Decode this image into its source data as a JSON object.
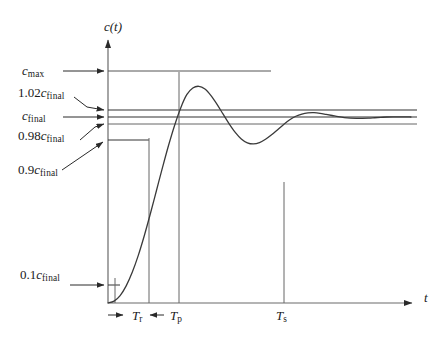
{
  "figure": {
    "title_axis_y": "c(t)",
    "title_axis_x": "t",
    "colors": {
      "curve": "#3a3a3a",
      "axis": "#555555",
      "guide": "#444444",
      "text": "#1a1a1a",
      "background": "#ffffff"
    }
  },
  "labels": {
    "c_max": {
      "coef": "",
      "base": "c",
      "sub": "max"
    },
    "c_102": {
      "coef": "1.02",
      "base": "c",
      "sub": "final"
    },
    "c_final": {
      "coef": "",
      "base": "c",
      "sub": "final"
    },
    "c_098": {
      "coef": "0.98",
      "base": "c",
      "sub": "final"
    },
    "c_09": {
      "coef": "0.9",
      "base": "c",
      "sub": "final"
    },
    "c_01": {
      "coef": "0.1",
      "base": "c",
      "sub": "final"
    },
    "t_r": {
      "base": "T",
      "sub": "r"
    },
    "t_p": {
      "base": "T",
      "sub": "p"
    },
    "t_s": {
      "base": "T",
      "sub": "s"
    }
  },
  "chart_data": {
    "type": "line",
    "title": "",
    "xlabel": "t",
    "ylabel": "c(t)",
    "grid": false,
    "legend": false,
    "levels": [
      {
        "name": "c_max",
        "label": "c max",
        "value": 1.165,
        "line_to_x": 0.53
      },
      {
        "name": "1.02c_final",
        "label": "1.02 c final",
        "value": 1.02,
        "line_to_x": 1.0
      },
      {
        "name": "c_final",
        "label": "c final",
        "value": 1.0,
        "line_to_x": 1.0
      },
      {
        "name": "0.98c_final",
        "label": "0.98 c final",
        "value": 0.98,
        "line_to_x": 1.0
      },
      {
        "name": "0.9c_final",
        "label": "0.9 c final",
        "value": 0.9,
        "line_to_x": 0.135
      },
      {
        "name": "0.1c_final",
        "label": "0.1 c final",
        "value": 0.1,
        "line_to_x": 0.05
      }
    ],
    "time_markers": [
      {
        "name": "T_r",
        "label": "T r",
        "x": 0.135,
        "meaning": "rise time"
      },
      {
        "name": "T_p",
        "label": "T p",
        "x": 0.3,
        "meaning": "peak time"
      },
      {
        "name": "T_s",
        "label": "T s",
        "x": 0.755,
        "meaning": "settling time"
      }
    ],
    "x": [
      0.0,
      0.02,
      0.04,
      0.06,
      0.08,
      0.1,
      0.12,
      0.14,
      0.16,
      0.18,
      0.2,
      0.22,
      0.24,
      0.26,
      0.28,
      0.3,
      0.32,
      0.34,
      0.36,
      0.38,
      0.4,
      0.42,
      0.44,
      0.46,
      0.48,
      0.5,
      0.52,
      0.54,
      0.56,
      0.58,
      0.6,
      0.62,
      0.64,
      0.66,
      0.68,
      0.7,
      0.72,
      0.74,
      0.76,
      0.78,
      0.8,
      0.82,
      0.84,
      0.86,
      0.88,
      0.9,
      0.92,
      0.94,
      0.96,
      0.98,
      1.0
    ],
    "y": [
      0.0,
      0.01,
      0.04,
      0.092,
      0.165,
      0.256,
      0.363,
      0.481,
      0.605,
      0.729,
      0.848,
      0.956,
      1.049,
      1.12,
      1.156,
      1.165,
      1.15,
      1.115,
      1.068,
      1.015,
      0.963,
      0.917,
      0.882,
      0.861,
      0.855,
      0.862,
      0.88,
      0.904,
      0.932,
      0.96,
      0.985,
      1.004,
      1.016,
      1.022,
      1.023,
      1.02,
      1.014,
      1.008,
      1.002,
      0.997,
      0.994,
      0.993,
      0.993,
      0.994,
      0.996,
      0.998,
      1.0,
      1.001,
      1.001,
      1.001,
      1.0
    ],
    "xlim": [
      0,
      1.02
    ],
    "ylim": [
      0,
      1.33
    ]
  }
}
